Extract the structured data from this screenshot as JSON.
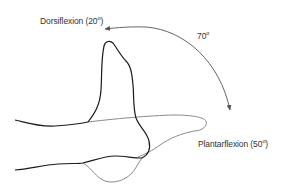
{
  "figure": {
    "type": "ankle-range-of-motion-diagram",
    "labels": {
      "dorsiflexion": {
        "name": "Dorsiflexion",
        "value": "20",
        "unit": "o",
        "open": " (",
        "close": ")"
      },
      "total_range": {
        "value": "70",
        "unit": "o"
      },
      "plantarflexion": {
        "name": "Plantarflexion",
        "value": "50",
        "unit": "o",
        "open": " (",
        "close": ")"
      }
    },
    "colors": {
      "dorsiflexed_foot": "#1a1a1a",
      "plantarflexed_foot": "#8a8a8a",
      "arc_arrow": "#555555",
      "text": "#333333",
      "background": "#ffffff"
    }
  }
}
